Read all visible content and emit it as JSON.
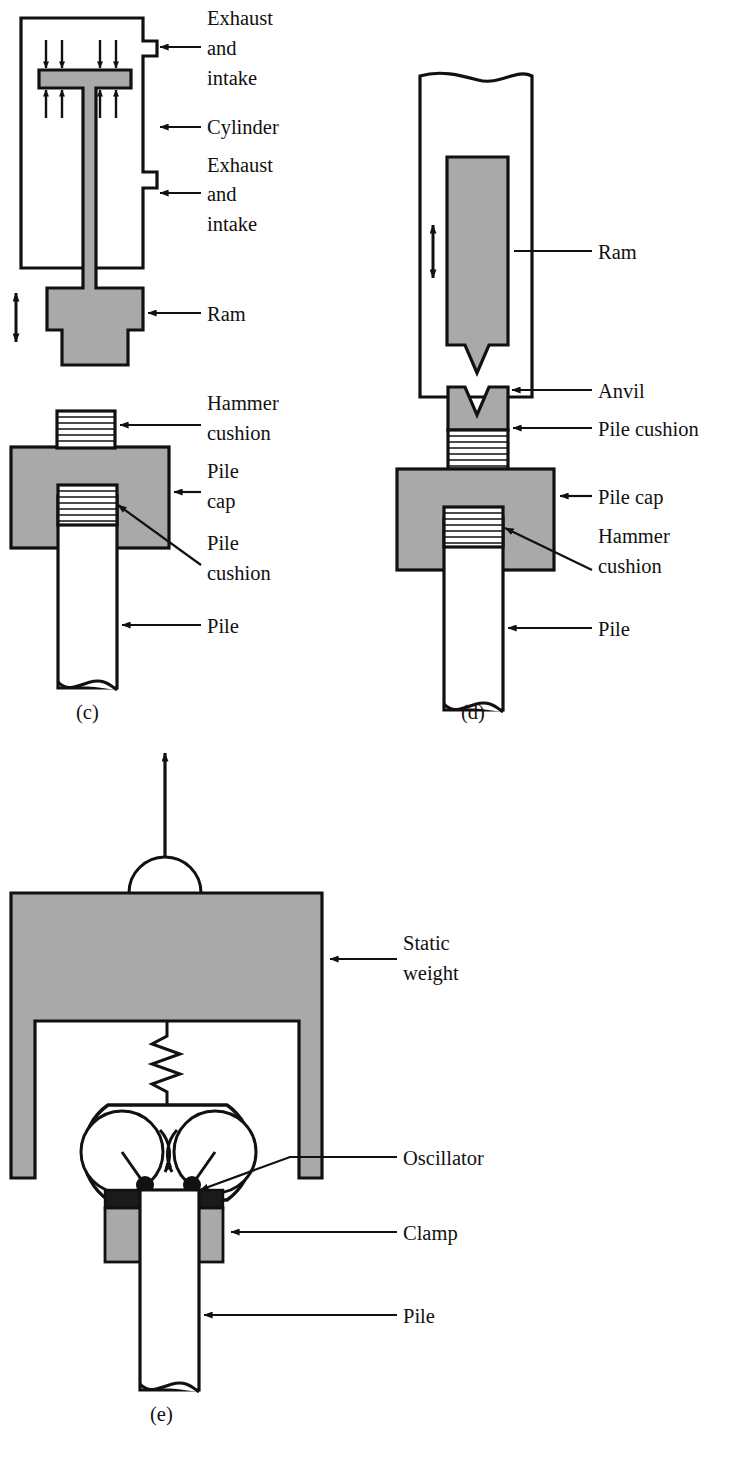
{
  "figure": {
    "colors": {
      "steel_gray": "#a9a9a9",
      "outline": "#111111",
      "background": "#ffffff",
      "clamp_black": "#1a1a1a",
      "cushion_fill": "#ffffff"
    },
    "panels": [
      {
        "id": "c",
        "letter": "(c)",
        "name": "double-acting-air-steam-hammer",
        "labels": [
          {
            "id": "exhaust-intake-top",
            "text_lines": [
              "Exhaust",
              "and",
              "intake"
            ]
          },
          {
            "id": "cylinder",
            "text_lines": [
              "Cylinder"
            ]
          },
          {
            "id": "exhaust-intake-bottom",
            "text_lines": [
              "Exhaust",
              "and",
              "intake"
            ]
          },
          {
            "id": "ram",
            "text_lines": [
              "Ram"
            ]
          },
          {
            "id": "hammer-cushion",
            "text_lines": [
              "Hammer",
              "cushion"
            ]
          },
          {
            "id": "pile-cap",
            "text_lines": [
              "Pile",
              "cap"
            ]
          },
          {
            "id": "pile-cushion",
            "text_lines": [
              "Pile",
              "cushion"
            ]
          },
          {
            "id": "pile",
            "text_lines": [
              "Pile"
            ]
          }
        ]
      },
      {
        "id": "d",
        "letter": "(d)",
        "name": "diesel-hammer",
        "labels": [
          {
            "id": "ram",
            "text_lines": [
              "Ram"
            ]
          },
          {
            "id": "anvil",
            "text_lines": [
              "Anvil"
            ]
          },
          {
            "id": "pile-cushion",
            "text_lines": [
              "Pile cushion"
            ]
          },
          {
            "id": "pile-cap",
            "text_lines": [
              "Pile cap"
            ]
          },
          {
            "id": "hammer-cushion",
            "text_lines": [
              "Hammer",
              "cushion"
            ]
          },
          {
            "id": "pile",
            "text_lines": [
              "Pile"
            ]
          }
        ]
      },
      {
        "id": "e",
        "letter": "(e)",
        "name": "vibratory-pile-driver",
        "labels": [
          {
            "id": "static-weight",
            "text_lines": [
              "Static",
              "weight"
            ]
          },
          {
            "id": "oscillator",
            "text_lines": [
              "Oscillator"
            ]
          },
          {
            "id": "clamp",
            "text_lines": [
              "Clamp"
            ]
          },
          {
            "id": "pile",
            "text_lines": [
              "Pile"
            ]
          }
        ]
      }
    ],
    "text": {
      "exhaust": "Exhaust",
      "and": "and",
      "intake": "intake",
      "cylinder": "Cylinder",
      "ram": "Ram",
      "hammer": "Hammer",
      "cushion": "cushion",
      "pile": "Pile",
      "cap": "cap",
      "pile_word": "Pile",
      "pile_cushion_one_line": "Pile cushion",
      "pile_cap_one_line": "Pile cap",
      "anvil": "Anvil",
      "static": "Static",
      "weight": "weight",
      "oscillator": "Oscillator",
      "clamp": "Clamp",
      "letter_c": "(c)",
      "letter_d": "(d)",
      "letter_e": "(e)"
    }
  }
}
